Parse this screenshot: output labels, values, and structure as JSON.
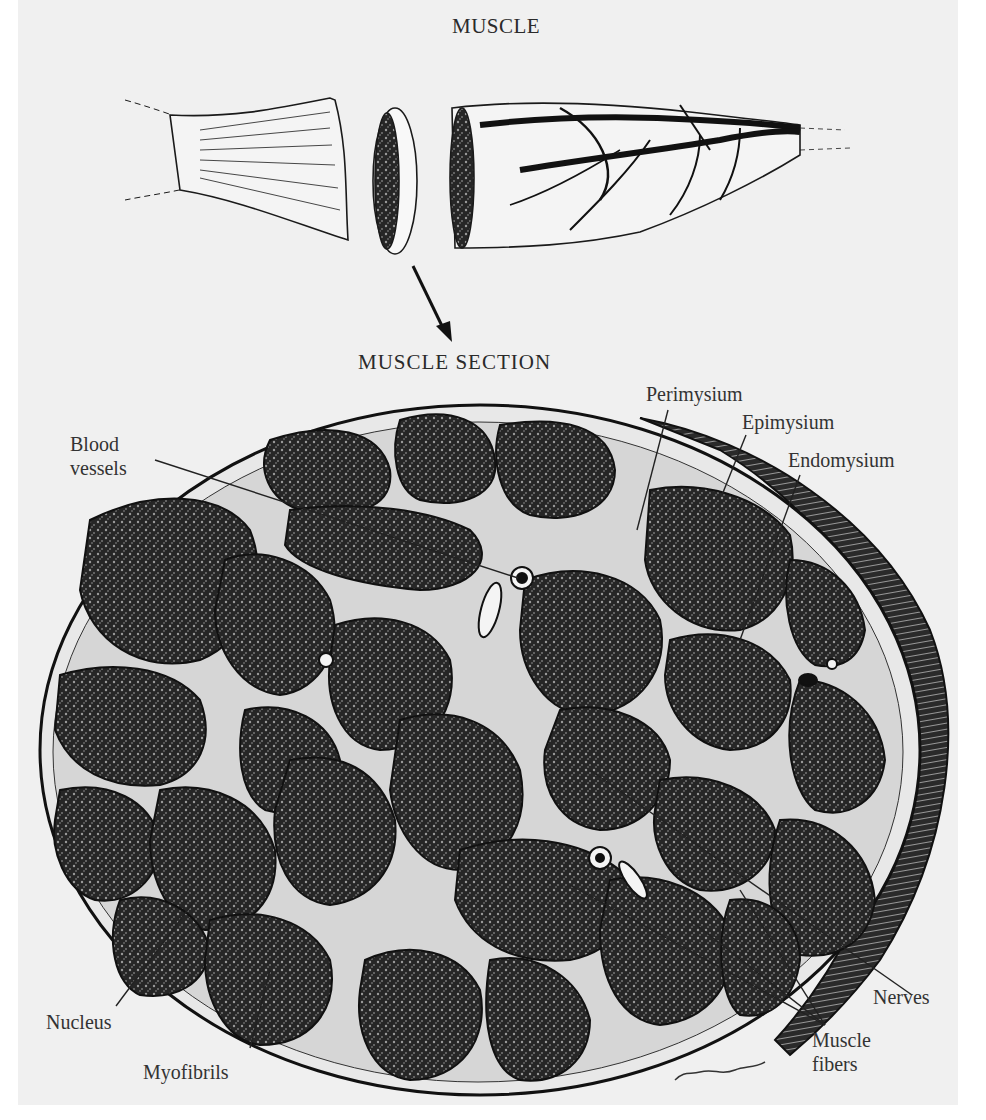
{
  "figure": {
    "top_title": "MUSCLE",
    "section_title": "MUSCLE SECTION",
    "labels": {
      "perimysium": "Perimysium",
      "epimysium": "Epimysium",
      "endomysium": "Endomysium",
      "blood_vessels_line1": "Blood",
      "blood_vessels_line2": "vessels",
      "nerves": "Nerves",
      "nucleus": "Nucleus",
      "myofibrils": "Myofibrils",
      "muscle_fibers_line1": "Muscle",
      "muscle_fibers_line2": "fibers"
    },
    "signature": "P. Sparks",
    "colors": {
      "background": "#f0f0f0",
      "ink": "#1a1a1a",
      "fascicle_fill": "#262626",
      "connective_tissue": "#e8e8e8"
    }
  }
}
